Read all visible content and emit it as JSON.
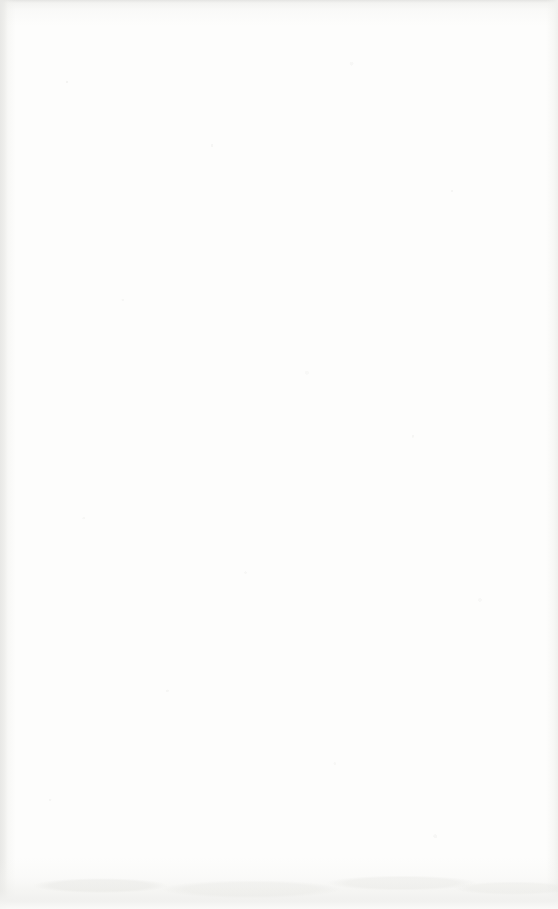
{
  "page": {
    "content": "",
    "text_elements": []
  },
  "colors": {
    "paper": "#fdfdfc",
    "edge_shadow": "#e8e8e6",
    "top_edge_line": "#e4e4e2",
    "right_band": "#f0f0ee",
    "bottom_band": "#f1f1ef"
  }
}
